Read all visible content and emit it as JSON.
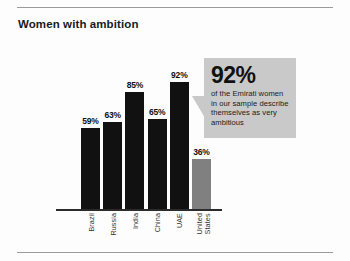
{
  "chart": {
    "title": "Women with ambition"
  },
  "callout": {
    "headline": "92%",
    "body": "of the Emirati women in our sample describe themselves as very ambitious"
  },
  "chart_data": {
    "type": "bar",
    "title": "Women with ambition",
    "xlabel": "",
    "ylabel": "",
    "ylim": [
      0,
      100
    ],
    "grid": false,
    "legend": "none",
    "categories": [
      "Brazil",
      "Russia",
      "India",
      "China",
      "UAE",
      "United States"
    ],
    "values": [
      59,
      63,
      85,
      65,
      92,
      36
    ],
    "value_labels": [
      "59%",
      "63%",
      "85%",
      "65%",
      "92%",
      "36%"
    ],
    "colors": [
      "#111111",
      "#111111",
      "#111111",
      "#111111",
      "#111111",
      "#808080"
    ],
    "highlight_category": "UAE",
    "annotations": [
      {
        "target": "UAE",
        "headline": "92%",
        "text": "of the Emirati women in our sample describe themselves as very ambitious"
      }
    ]
  },
  "colors": {
    "bar_dark": "#111111",
    "bar_gray": "#808080",
    "callout_bg": "#c9c9c9",
    "rule": "#9a9a9a",
    "axis": "#2b2b2b"
  }
}
